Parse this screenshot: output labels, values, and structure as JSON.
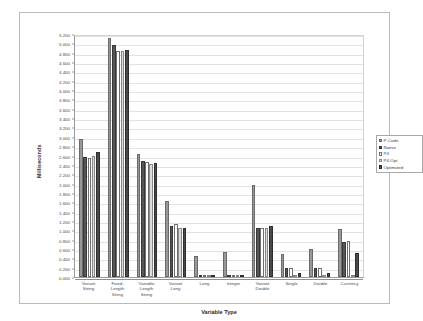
{
  "chart_data": {
    "type": "bar",
    "title": "",
    "xlabel": "Variable Type",
    "ylabel": "Milliseconds",
    "ylim": [
      0.0,
      5.2
    ],
    "ytick_step": 0.2,
    "grid": true,
    "legend_position": "right",
    "ytick_labels": [
      "5.200",
      "5.000",
      "4.800",
      "4.600",
      "4.400",
      "4.200",
      "4.000",
      "3.800",
      "3.600",
      "3.400",
      "3.200",
      "3.000",
      "2.800",
      "2.600",
      "2.400",
      "2.200",
      "2.000",
      "1.800",
      "1.600",
      "1.400",
      "1.200",
      "1.000",
      "0.800",
      "0.600",
      "0.400",
      "0.200",
      "0.000"
    ],
    "ytick_values": [
      5.2,
      5.0,
      4.8,
      4.6,
      4.4,
      4.2,
      4.0,
      3.8,
      3.6,
      3.4,
      3.2,
      3.0,
      2.8,
      2.6,
      2.4,
      2.2,
      2.0,
      1.8,
      1.6,
      1.4,
      1.2,
      1.0,
      0.8,
      0.6,
      0.4,
      0.2,
      0.0
    ],
    "categories": [
      "Variant\nString",
      "Fixed-\nLength\nString",
      "Variable\nLength\nString",
      "Variant\nLong",
      "Long",
      "Integer",
      "Variant\nDouble",
      "Single",
      "Double",
      "Currency"
    ],
    "series": [
      {
        "name": "P-Code",
        "color": "#989898",
        "values": [
          2.95,
          5.12,
          2.64,
          1.62,
          0.44,
          0.53,
          1.96,
          0.5,
          0.6,
          1.02
        ]
      },
      {
        "name": "Native",
        "color": "#565656",
        "values": [
          2.56,
          4.97,
          2.48,
          1.1,
          0.03,
          0.04,
          1.05,
          0.2,
          0.2,
          0.76
        ]
      },
      {
        "name": "P4",
        "color": "#ffffff",
        "values": [
          2.55,
          4.84,
          2.47,
          1.13,
          0.03,
          0.04,
          1.05,
          0.2,
          0.2,
          0.77
        ]
      },
      {
        "name": "P4-Opt",
        "color": "#dcdcdc",
        "values": [
          2.58,
          4.84,
          2.42,
          1.04,
          0.01,
          0.02,
          1.04,
          0.02,
          0.02,
          0.02
        ]
      },
      {
        "name": "Optimized",
        "color": "#4a4a4a",
        "values": [
          2.67,
          4.86,
          2.45,
          1.04,
          0.02,
          0.02,
          1.1,
          0.08,
          0.08,
          0.52
        ]
      }
    ]
  }
}
